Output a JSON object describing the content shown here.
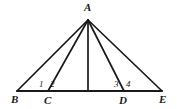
{
  "figure": {
    "type": "geometry-diagram",
    "background_color": "#ffffff",
    "stroke_color": "#1a1a1a",
    "text_color": "#1a1a1a",
    "width": 177,
    "height": 109
  },
  "points": {
    "A": {
      "label": "A",
      "x": 88,
      "y": 20,
      "label_x": 84,
      "label_y": 2
    },
    "B": {
      "label": "B",
      "x": 17,
      "y": 91,
      "label_x": 11,
      "label_y": 94
    },
    "C": {
      "label": "C",
      "x": 48,
      "y": 91,
      "label_x": 44,
      "label_y": 95
    },
    "D": {
      "label": "D",
      "x": 124,
      "y": 91,
      "label_x": 119,
      "label_y": 95
    },
    "E": {
      "label": "E",
      "x": 162,
      "y": 91,
      "label_x": 159,
      "label_y": 94
    },
    "F": {
      "label": "",
      "x": 88,
      "y": 91,
      "label_x": 88,
      "label_y": 91
    }
  },
  "segments": [
    {
      "name": "base-BE",
      "from": "B",
      "to": "E"
    },
    {
      "name": "side-AB",
      "from": "A",
      "to": "B"
    },
    {
      "name": "cevian-AC",
      "from": "A",
      "to": "C"
    },
    {
      "name": "altitude-AF",
      "from": "A",
      "to": "F"
    },
    {
      "name": "cevian-AD",
      "from": "A",
      "to": "D"
    },
    {
      "name": "side-AE",
      "from": "A",
      "to": "E"
    }
  ],
  "angle_labels": [
    {
      "name": "angle-1",
      "text": "1",
      "x": 39,
      "y": 80
    },
    {
      "name": "angle-2",
      "text": "2",
      "x": 50,
      "y": 80
    },
    {
      "name": "angle-3",
      "text": "3",
      "x": 114,
      "y": 80
    },
    {
      "name": "angle-4",
      "text": "4",
      "x": 126,
      "y": 80
    }
  ]
}
